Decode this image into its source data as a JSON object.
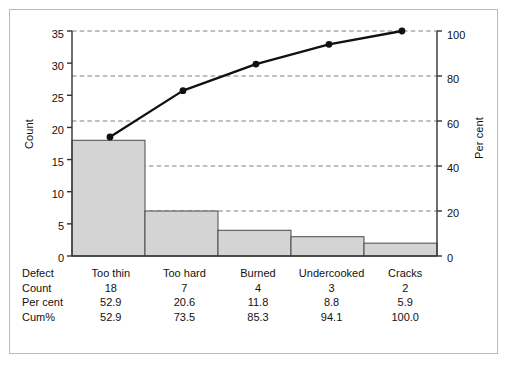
{
  "chart_data": {
    "type": "bar",
    "title": "",
    "subtitle": "",
    "xlabel": "",
    "ylabel": "Count",
    "y2label": "Per cent",
    "categories": [
      "Too thin",
      "Too hard",
      "Burned",
      "Undercooked",
      "Cracks"
    ],
    "series": [
      {
        "name": "Count",
        "type": "bar",
        "values": [
          18,
          7,
          4,
          3,
          2
        ]
      },
      {
        "name": "Cum%",
        "type": "line",
        "values": [
          52.9,
          73.5,
          85.3,
          94.1,
          100.0
        ]
      }
    ],
    "percent": [
      52.9,
      20.6,
      11.8,
      8.8,
      5.9
    ],
    "ylim": [
      0,
      35
    ],
    "y2lim": [
      0,
      100
    ],
    "yticks": [
      0,
      5,
      10,
      15,
      20,
      25,
      30,
      35
    ],
    "y2ticks": [
      0,
      20,
      40,
      60,
      80,
      100
    ],
    "grid": true,
    "grid_axis": "y2",
    "legend": "none",
    "total_count": 34,
    "colors": {
      "bar_fill": "#d4d4d4",
      "bar_edge": "#4a4a4a",
      "line": "#111111",
      "marker": "#111111",
      "grid": "#6f6f6f",
      "axis": "#333333",
      "frame": "#b9b9b9",
      "background": "#ffffff"
    }
  },
  "axes": {
    "left": {
      "title": "Count",
      "ticks": [
        "0",
        "5",
        "10",
        "15",
        "20",
        "25",
        "30",
        "35"
      ]
    },
    "right": {
      "title": "Per cent",
      "ticks": [
        "0",
        "20",
        "40",
        "60",
        "80",
        "100"
      ]
    }
  },
  "table": {
    "header": {
      "label": "Defect",
      "values": [
        "Too thin",
        "Too hard",
        "Burned",
        "Undercooked",
        "Cracks"
      ]
    },
    "rows": [
      {
        "label": "Count",
        "values": [
          "18",
          "7",
          "4",
          "3",
          "2"
        ]
      },
      {
        "label": "Per cent",
        "values": [
          "52.9",
          "20.6",
          "11.8",
          "8.8",
          "5.9"
        ]
      },
      {
        "label": "Cum%",
        "values": [
          "52.9",
          "73.5",
          "85.3",
          "94.1",
          "100.0"
        ]
      }
    ]
  }
}
